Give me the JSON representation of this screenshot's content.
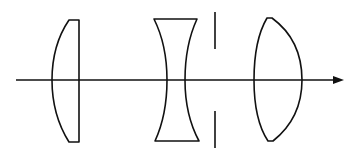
{
  "diagram": {
    "type": "optical-system",
    "colors": {
      "stroke": "#111111",
      "background": "#ffffff"
    },
    "elements": [
      {
        "id": "lens-1",
        "kind": "plano-convex-lens"
      },
      {
        "id": "lens-2",
        "kind": "biconcave-lens"
      },
      {
        "id": "aperture-stop",
        "kind": "aperture-stop"
      },
      {
        "id": "lens-3",
        "kind": "biconvex-lens"
      },
      {
        "id": "optical-axis",
        "kind": "axis-arrow",
        "direction": "right"
      }
    ]
  }
}
